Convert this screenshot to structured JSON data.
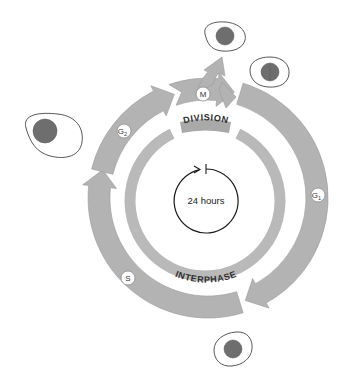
{
  "diagram": {
    "center_label": "24 hours",
    "bands": {
      "top": "DIVISION",
      "bottom": "INTERPHASE"
    },
    "phases": [
      {
        "id": "M",
        "label": "M",
        "sub": ""
      },
      {
        "id": "G1",
        "label": "G",
        "sub": "1"
      },
      {
        "id": "S",
        "label": "S",
        "sub": ""
      },
      {
        "id": "G2",
        "label": "G",
        "sub": "2"
      }
    ],
    "cells": [
      {
        "name": "cell-g2",
        "description": "large cell before division"
      },
      {
        "name": "cell-daughter-1",
        "description": "daughter cell after mitosis"
      },
      {
        "name": "cell-daughter-2",
        "description": "daughter cell after mitosis"
      },
      {
        "name": "cell-g1",
        "description": "small cell in G1"
      }
    ],
    "colors": {
      "arrow_fill": "#b3b3b3",
      "band_fill": "#b9b9b9",
      "nucleus": "#6e6e6e",
      "outline": "#444444"
    }
  }
}
